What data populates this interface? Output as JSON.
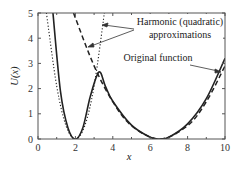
{
  "chart_data": {
    "type": "line",
    "title": "",
    "xlabel": "x",
    "ylabel": "U(x)",
    "xlim": [
      0,
      10
    ],
    "ylim": [
      0,
      5
    ],
    "xticks": [
      "0",
      "2",
      "4",
      "6",
      "8",
      "10"
    ],
    "yticks": [
      "0",
      "1",
      "2",
      "3",
      "4",
      "5"
    ],
    "grid": false,
    "legend": null,
    "annotations": [
      {
        "text_lines": [
          "Harmonic (quadratic)",
          "approximations"
        ],
        "points_to": [
          "dotted parabola near x=3.3",
          "dashed parabola near x=2.5"
        ]
      },
      {
        "text": "Original function",
        "points_to": "solid curve near x=9.8"
      }
    ],
    "series": [
      {
        "name": "Original function",
        "style": "solid",
        "x": [
          0.8,
          1.2,
          1.6,
          2.0,
          2.4,
          2.8,
          3.26,
          3.6,
          4.0,
          5.0,
          6.0,
          6.5,
          7.0,
          8.0,
          9.0,
          10.0
        ],
        "y": [
          5.0,
          1.9,
          0.45,
          0.0,
          0.45,
          1.7,
          2.66,
          2.1,
          1.5,
          0.55,
          0.07,
          0.0,
          0.07,
          0.6,
          1.6,
          3.2
        ]
      },
      {
        "name": "Harmonic approximation (x=2)",
        "style": "dotted",
        "x": [
          0.45,
          1.0,
          1.5,
          2.0,
          2.5,
          3.0,
          3.55
        ],
        "y": [
          5.0,
          2.1,
          0.52,
          0.0,
          0.52,
          2.1,
          5.0
        ]
      },
      {
        "name": "Harmonic approximation (x=6.5)",
        "style": "dashed",
        "x": [
          1.9,
          3.0,
          4.0,
          5.0,
          6.5,
          8.0,
          9.0,
          10.0
        ],
        "y": [
          5.0,
          2.9,
          1.48,
          0.53,
          0.0,
          0.53,
          1.48,
          2.9
        ]
      }
    ]
  },
  "labels": {
    "annotation_1_line1": "Harmonic (quadratic)",
    "annotation_1_line2": "approximations",
    "annotation_2": "Original function",
    "xlabel": "x",
    "ylabel": "U(x)"
  }
}
